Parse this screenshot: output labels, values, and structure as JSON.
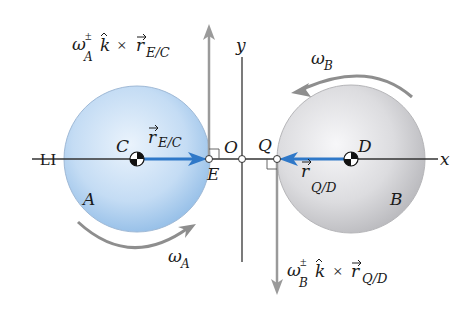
{
  "diagram": {
    "line_label": "LI",
    "axes": {
      "x_label": "x",
      "y_label": "y",
      "origin_label": "O"
    },
    "bodies": [
      {
        "name": "A",
        "center_label": "C",
        "contact_point_label": "E",
        "color": "#a9cdee",
        "angular_velocity_label": "ω",
        "angular_velocity_sub": "A",
        "rotation": "counterclockwise-arrow-bottom"
      },
      {
        "name": "B",
        "center_label": "D",
        "contact_point_label": "Q",
        "color": "#d6d6d8",
        "angular_velocity_label": "ω",
        "angular_velocity_sub": "B",
        "rotation": "counterclockwise-arrow-top"
      }
    ],
    "vectors": {
      "r_EC": {
        "base": "r",
        "sub": "E/C",
        "color": "#2f78c8"
      },
      "r_QD": {
        "base": "r",
        "sub": "Q/D",
        "color": "#2f78c8"
      }
    },
    "velocity_labels": {
      "E": {
        "omega": "ω",
        "sup": "±",
        "sub": "A",
        "k": "k",
        "times": "×",
        "r": "r",
        "r_sub": "E/C"
      },
      "Q": {
        "omega": "ω",
        "sup": "±",
        "sub": "B",
        "k": "k",
        "times": "×",
        "r": "r",
        "r_sub": "Q/D"
      }
    },
    "colors": {
      "axis": "#333333",
      "velocity_arrow": "#9a9a9a",
      "rotation_arrow": "#8e8e8e",
      "position_vector": "#2f78c8"
    }
  }
}
